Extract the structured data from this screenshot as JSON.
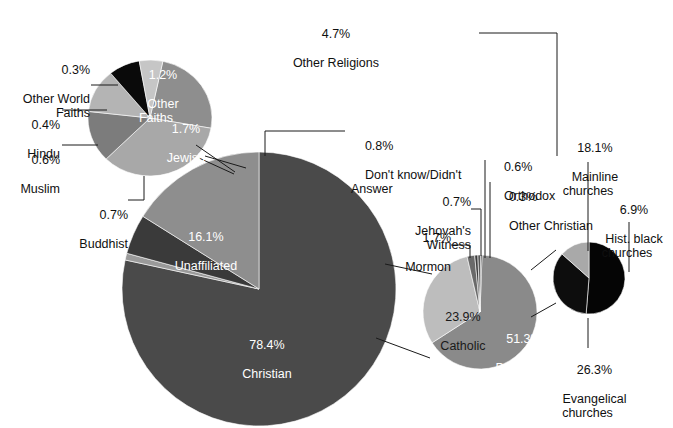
{
  "figure": {
    "background": "#ffffff",
    "text_color": "#101010"
  },
  "chart_data": {
    "type": "pie",
    "xlabel": "",
    "ylabel": "",
    "legend": "none",
    "grid": false,
    "charts": [
      {
        "name": "other-religions-breakdown",
        "note": "Exploded detail of the 4.7% Other Religions slice",
        "categories": [
          "Other Faiths",
          "Jewish",
          "Buddhist",
          "Muslim",
          "Hindu",
          "Other World Faiths"
        ],
        "values": [
          1.2,
          1.7,
          0.7,
          0.6,
          0.4,
          0.3
        ],
        "labels": [
          "1.2%",
          "1.7%",
          "0.7%",
          "0.6%",
          "0.4%",
          "0.3%"
        ],
        "colors": [
          "#8e8e8e",
          "#a8a8a8",
          "#7c7c7c",
          "#b4b4b4",
          "#0a0a0a",
          "#c6c6c6"
        ]
      },
      {
        "name": "main-religious-landscape",
        "categories": [
          "Christian",
          "Don't know/Didn't Answer",
          "Other Religions",
          "Unaffiliated"
        ],
        "values": [
          78.4,
          0.8,
          4.7,
          16.1
        ],
        "labels": [
          "78.4%",
          "0.8%",
          "4.7%",
          "16.1%"
        ],
        "colors": [
          "#4a4a4a",
          "#9a9a9a",
          "#3a3a3a",
          "#8e8e8e"
        ]
      },
      {
        "name": "christian-breakdown",
        "note": "Exploded detail of the 78.4% Christian slice",
        "categories": [
          "Protestant",
          "Catholic",
          "Mormon",
          "Jehovah's Witness",
          "Orthodox",
          "Other Christian"
        ],
        "values": [
          51.3,
          23.9,
          1.7,
          0.7,
          0.6,
          0.3
        ],
        "labels": [
          "51.3%",
          "23.9%",
          "1.7%",
          "0.7%",
          "0.6%",
          "0.3%"
        ],
        "colors": [
          "#8a8a8a",
          "#bdbdbd",
          "#6a6a6a",
          "#3c3c3c",
          "#585858",
          "#2a2a2a"
        ]
      },
      {
        "name": "protestant-breakdown",
        "note": "Exploded detail of the 51.3% Protestant slice",
        "categories": [
          "Evangelical churches",
          "Mainline churches",
          "Hist. black churches"
        ],
        "values": [
          26.3,
          18.1,
          6.9
        ],
        "labels": [
          "26.3%",
          "18.1%",
          "6.9%"
        ],
        "colors": [
          "#050505",
          "#0d0d0d",
          "#a9a9a9"
        ]
      }
    ]
  },
  "labels": {
    "other_world_faiths": {
      "pct": "0.3%",
      "name": "Other World\nFaiths"
    },
    "hindu": {
      "pct": "0.4%",
      "name": "Hindu"
    },
    "muslim": {
      "pct": "0.6%",
      "name": "Muslim"
    },
    "buddhist": {
      "pct": "0.7%",
      "name": "Buddhist"
    },
    "other_religions": {
      "pct": "4.7%",
      "name": "Other Religions"
    },
    "other_faiths_inner": {
      "pct": "1.2%",
      "name": "Other\nFaiths"
    },
    "jewish_inner": {
      "pct": "1.7%",
      "name": "Jewish"
    },
    "unaffiliated_inner": {
      "pct": "16.1%",
      "name": "Unaffiliated"
    },
    "christian_inner": {
      "pct": "78.4%",
      "name": "Christian"
    },
    "dont_know": {
      "pct": "0.8%",
      "name": "Don't know/Didn't\nAnswer"
    },
    "jehovahs_witness": {
      "pct": "0.7%",
      "name": "Jehovah's\nWitness"
    },
    "mormon": {
      "pct": "1.7%",
      "name": "Mormon"
    },
    "orthodox": {
      "pct": "0.6%",
      "name": "Orthodox"
    },
    "other_christian": {
      "pct": "0.3%",
      "name": "Other Christian"
    },
    "catholic_inner": {
      "pct": "23.9%",
      "name": "Catholic"
    },
    "protestant_inner": {
      "pct": "51.3%",
      "name": "Protestant"
    },
    "mainline": {
      "pct": "18.1%",
      "name": "Mainline\nchurches"
    },
    "hist_black": {
      "pct": "6.9%",
      "name": "Hist. black\nchurches"
    },
    "evangelical": {
      "pct": "26.3%",
      "name": "Evangelical\nchurches"
    }
  }
}
